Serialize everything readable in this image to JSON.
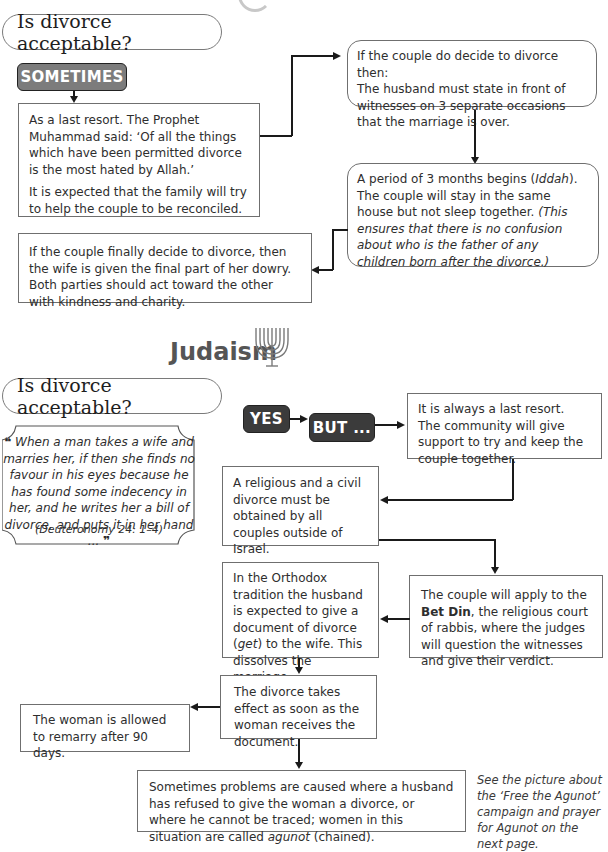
{
  "islam": {
    "question": "Is divorce acceptable?",
    "answer_badge": "SOMETIMES",
    "box_last_resort": {
      "p1": "As a last resort. The Prophet Muhammad said: ‘Of all the things which have been permitted divorce is the most hated by Allah.’",
      "p2": "It is expected that the family will try to help the couple to be reconciled."
    },
    "box_decide": {
      "line1": "If the couple do decide to divorce then:",
      "line2": "The husband must state in front of witnesses on 3 separate occasions that the marriage is over."
    },
    "box_iddah": {
      "text_a": "A period of 3 months begins (",
      "term": "Iddah",
      "text_b": "). The couple will stay in the same house but not sleep together. ",
      "italic_note": "(This ensures that there is no confusion about who is the father of any children born after the divorce.)"
    },
    "box_final": "If the couple finally decide to divorce, then the wife is given the final part of her dowry. Both parties should act toward the other with kindness and charity."
  },
  "judaism": {
    "section_title": "Judaism",
    "section_icon": "menorah-icon",
    "question": "Is divorce acceptable?",
    "badge_yes": "YES",
    "badge_but": "BUT ...",
    "quote": {
      "open_mark": "❝",
      "text": "When a man takes a wife and marries her, if then she finds no favour in his eyes because he has found some indecency in her, and he writes her a bill of divorce, and puts it in her hand ...",
      "close_mark": "❞",
      "citation": "(Deuteronomy 24: 1–4)"
    },
    "box_last_resort": {
      "line1": "It is always a last resort.",
      "line2": "The community will give support to try and keep the couple together."
    },
    "box_civil": "A religious and a civil divorce must be obtained by all couples outside of Israel.",
    "box_bet_din": {
      "text_a": "The couple will apply to the ",
      "bold": "Bet Din",
      "text_b": ", the religious court of rabbis, where the judges will question the witnesses and give their verdict."
    },
    "box_orthodox": {
      "text_a": "In the Orthodox tradition the husband is expected to give a document of divorce (",
      "term": "get",
      "text_b": ") to the wife. This dissolves the marriage."
    },
    "box_takes_effect": "The divorce takes effect as soon as the woman receives the document.",
    "box_remarry": "The woman is allowed to remarry after 90 days.",
    "box_agunot": {
      "text_a": "Sometimes problems are caused where a husband has refused to give the woman a divorce, or where he cannot be traced; women in this situation are called ",
      "term": "agunot",
      "text_b": " (chained)."
    },
    "side_note": "See the picture about the ‘Free the Agunot’ campaign and prayer for Agunot on the next page."
  },
  "colors": {
    "badge_grey": "#7c7c7c",
    "badge_dark": "#3b3b3b",
    "border": "#6f6f6f",
    "arrow": "#1a1a1a"
  }
}
